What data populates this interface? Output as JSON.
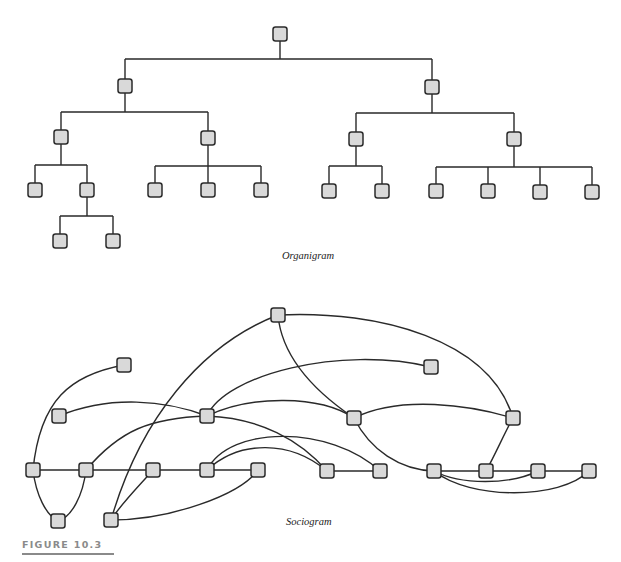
{
  "figure": {
    "label": "FIGURE 10.3"
  },
  "style": {
    "node_fill": "#d9d9d9",
    "node_stroke": "#2b2b2b",
    "edge_stroke": "#2a2a2a",
    "figure_label_color": "#8a8a8a"
  },
  "organigram": {
    "caption": "Organigram",
    "node_size": 14,
    "nodes": [
      {
        "id": "root",
        "x": 280,
        "y": 34
      },
      {
        "id": "L1a",
        "x": 125,
        "y": 86
      },
      {
        "id": "L1b",
        "x": 432,
        "y": 87
      },
      {
        "id": "L2a",
        "x": 61,
        "y": 137
      },
      {
        "id": "L2b",
        "x": 208,
        "y": 138
      },
      {
        "id": "L2c",
        "x": 356,
        "y": 139
      },
      {
        "id": "L2d",
        "x": 514,
        "y": 139
      },
      {
        "id": "L3a",
        "x": 35,
        "y": 190
      },
      {
        "id": "L3b",
        "x": 87,
        "y": 190
      },
      {
        "id": "L3c",
        "x": 155,
        "y": 190
      },
      {
        "id": "L3d",
        "x": 208,
        "y": 190
      },
      {
        "id": "L3e",
        "x": 261,
        "y": 190
      },
      {
        "id": "L3f",
        "x": 329,
        "y": 191
      },
      {
        "id": "L3g",
        "x": 382,
        "y": 191
      },
      {
        "id": "L3h",
        "x": 436,
        "y": 191
      },
      {
        "id": "L3i",
        "x": 488,
        "y": 191
      },
      {
        "id": "L3j",
        "x": 540,
        "y": 192
      },
      {
        "id": "L3k",
        "x": 592,
        "y": 192
      },
      {
        "id": "L4a",
        "x": 60,
        "y": 241
      },
      {
        "id": "L4b",
        "x": 113,
        "y": 241
      }
    ],
    "groups": [
      {
        "parent": "root",
        "bar_y": 59,
        "children": [
          "L1a",
          "L1b"
        ]
      },
      {
        "parent": "L1a",
        "bar_y": 112,
        "children": [
          "L2a",
          "L2b"
        ]
      },
      {
        "parent": "L1b",
        "bar_y": 113,
        "children": [
          "L2c",
          "L2d"
        ]
      },
      {
        "parent": "L2a",
        "bar_y": 165,
        "children": [
          "L3a",
          "L3b"
        ]
      },
      {
        "parent": "L2b",
        "bar_y": 166,
        "children": [
          "L3c",
          "L3d",
          "L3e"
        ]
      },
      {
        "parent": "L2c",
        "bar_y": 166,
        "children": [
          "L3f",
          "L3g"
        ]
      },
      {
        "parent": "L2d",
        "bar_y": 167,
        "children": [
          "L3h",
          "L3i",
          "L3j",
          "L3k"
        ]
      },
      {
        "parent": "L3b",
        "bar_y": 216,
        "children": [
          "L4a",
          "L4b"
        ]
      }
    ]
  },
  "sociogram": {
    "caption": "Sociogram",
    "node_size": 14,
    "nodes": [
      {
        "id": "S1",
        "x": 278,
        "y": 315
      },
      {
        "id": "S2",
        "x": 124,
        "y": 365
      },
      {
        "id": "S3",
        "x": 431,
        "y": 367
      },
      {
        "id": "S4",
        "x": 59,
        "y": 416
      },
      {
        "id": "S5",
        "x": 207,
        "y": 416
      },
      {
        "id": "S6",
        "x": 354,
        "y": 418
      },
      {
        "id": "S7",
        "x": 513,
        "y": 418
      },
      {
        "id": "S8",
        "x": 33,
        "y": 470
      },
      {
        "id": "S9",
        "x": 86,
        "y": 470
      },
      {
        "id": "S10",
        "x": 153,
        "y": 470
      },
      {
        "id": "S11",
        "x": 207,
        "y": 470
      },
      {
        "id": "S12",
        "x": 258,
        "y": 470
      },
      {
        "id": "S13",
        "x": 327,
        "y": 471
      },
      {
        "id": "S14",
        "x": 380,
        "y": 471
      },
      {
        "id": "S15",
        "x": 434,
        "y": 471
      },
      {
        "id": "S16",
        "x": 486,
        "y": 471
      },
      {
        "id": "S17",
        "x": 538,
        "y": 471
      },
      {
        "id": "S18",
        "x": 589,
        "y": 471
      },
      {
        "id": "S19",
        "x": 58,
        "y": 521
      },
      {
        "id": "S20",
        "x": 111,
        "y": 520
      }
    ],
    "edges": [
      {
        "from": "S8",
        "to": "S9",
        "c": [
          [
            50,
            470
          ],
          [
            70,
            470
          ]
        ]
      },
      {
        "from": "S9",
        "to": "S10",
        "c": [
          [
            110,
            470
          ],
          [
            130,
            470
          ]
        ]
      },
      {
        "from": "S10",
        "to": "S11",
        "c": [
          [
            170,
            470
          ],
          [
            190,
            470
          ]
        ]
      },
      {
        "from": "S11",
        "to": "S12",
        "c": [
          [
            225,
            470
          ],
          [
            240,
            470
          ]
        ]
      },
      {
        "from": "S13",
        "to": "S14",
        "c": [
          [
            345,
            471
          ],
          [
            362,
            471
          ]
        ]
      },
      {
        "from": "S15",
        "to": "S16",
        "c": [
          [
            452,
            471
          ],
          [
            468,
            471
          ]
        ]
      },
      {
        "from": "S16",
        "to": "S17",
        "c": [
          [
            504,
            471
          ],
          [
            520,
            471
          ]
        ]
      },
      {
        "from": "S17",
        "to": "S18",
        "c": [
          [
            556,
            471
          ],
          [
            572,
            471
          ]
        ]
      },
      {
        "from": "S8",
        "to": "S2",
        "c": [
          [
            40,
            400
          ],
          [
            70,
            375
          ]
        ]
      },
      {
        "from": "S8",
        "to": "S19",
        "c": [
          [
            36,
            495
          ],
          [
            46,
            515
          ]
        ]
      },
      {
        "from": "S9",
        "to": "S19",
        "c": [
          [
            83,
            495
          ],
          [
            72,
            517
          ]
        ]
      },
      {
        "from": "S4",
        "to": "S5",
        "c": [
          [
            110,
            395
          ],
          [
            165,
            400
          ]
        ]
      },
      {
        "from": "S9",
        "to": "S5",
        "c": [
          [
            120,
            430
          ],
          [
            150,
            418
          ]
        ]
      },
      {
        "from": "S5",
        "to": "S13",
        "c": [
          [
            260,
            418
          ],
          [
            300,
            440
          ]
        ]
      },
      {
        "from": "S5",
        "to": "S3",
        "c": [
          [
            225,
            375
          ],
          [
            340,
            345
          ]
        ]
      },
      {
        "from": "S5",
        "to": "S6",
        "c": [
          [
            250,
            395
          ],
          [
            320,
            395
          ]
        ]
      },
      {
        "from": "S1",
        "to": "S20",
        "c": [
          [
            200,
            345
          ],
          [
            140,
            420
          ]
        ]
      },
      {
        "from": "S1",
        "to": "S6",
        "c": [
          [
            282,
            360
          ],
          [
            320,
            395
          ]
        ]
      },
      {
        "from": "S1",
        "to": "S7",
        "c": [
          [
            380,
            310
          ],
          [
            490,
            340
          ]
        ]
      },
      {
        "from": "S6",
        "to": "S7",
        "c": [
          [
            400,
            395
          ],
          [
            470,
            405
          ]
        ]
      },
      {
        "from": "S6",
        "to": "S15",
        "c": [
          [
            370,
            450
          ],
          [
            400,
            470
          ]
        ]
      },
      {
        "from": "S7",
        "to": "S16",
        "c": [
          [
            505,
            432
          ],
          [
            495,
            455
          ]
        ]
      },
      {
        "from": "S11",
        "to": "S13",
        "c": [
          [
            240,
            440
          ],
          [
            290,
            440
          ]
        ]
      },
      {
        "from": "S11",
        "to": "S14",
        "c": [
          [
            230,
            425
          ],
          [
            330,
            425
          ]
        ]
      },
      {
        "from": "S10",
        "to": "S20",
        "c": [
          [
            140,
            485
          ],
          [
            120,
            505
          ]
        ]
      },
      {
        "from": "S12",
        "to": "S20",
        "c": [
          [
            240,
            495
          ],
          [
            170,
            520
          ]
        ]
      },
      {
        "from": "S15",
        "to": "S17",
        "c": [
          [
            460,
            485
          ],
          [
            510,
            485
          ]
        ]
      },
      {
        "from": "S15",
        "to": "S18",
        "c": [
          [
            470,
            500
          ],
          [
            560,
            500
          ]
        ]
      }
    ]
  }
}
